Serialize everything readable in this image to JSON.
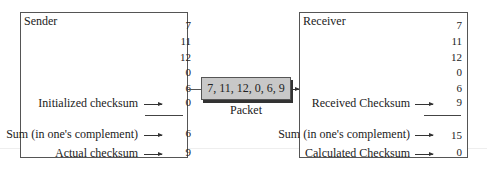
{
  "sender": {
    "title": "Sender",
    "values": [
      "7",
      "11",
      "12",
      "0",
      "6"
    ],
    "initialized_label": "Initialized checksum",
    "initialized_value": "0",
    "sum_label": "Sum (in one's complement)",
    "sum_value": "6",
    "actual_label": "Actual checksum",
    "actual_value": "9"
  },
  "packet": {
    "content": "7, 11, 12, 0, 6, 9",
    "label": "Packet"
  },
  "receiver": {
    "title": "Receiver",
    "values": [
      "7",
      "11",
      "12",
      "0",
      "6"
    ],
    "received_label": "Received Checksum",
    "received_value": "9",
    "sum_label": "Sum (in one's complement)",
    "sum_value": "15",
    "calculated_label": "Calculated Checksum",
    "calculated_value": "0"
  }
}
